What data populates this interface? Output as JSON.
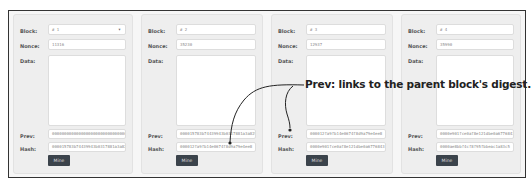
{
  "labels": {
    "block": "Block:",
    "nonce": "Nonce:",
    "data": "Data:",
    "prev": "Prev:",
    "hash": "Hash:",
    "mine": "Mine"
  },
  "blocks": [
    {
      "block": "# 1",
      "nonce": "11316",
      "data": "",
      "prev": "0000000000000000000000000000000000000000000000000000000000000000",
      "hash": "000015783b74439943b0317881a3a825"
    },
    {
      "block": "# 2",
      "nonce": "35230",
      "data": "",
      "prev": "000015783b74439943b0317881a3a825",
      "hash": "000012fa9fb14e0674f8d9a79e4ee8"
    },
    {
      "block": "# 3",
      "nonce": "12937",
      "data": "",
      "prev": "000012fa9fb14e0674f8d9a79e4ee8",
      "hash": "0000e901fce0af8e121dbe0a6776843"
    },
    {
      "block": "# 4",
      "nonce": "35990",
      "data": "",
      "prev": "0000e901fce0af8e121dbe0a6776843",
      "hash": "0000ae8bbf4cf8f95fbbeac1a83c5"
    }
  ],
  "annotation": {
    "text": "Prev: links to the parent block's digest."
  }
}
